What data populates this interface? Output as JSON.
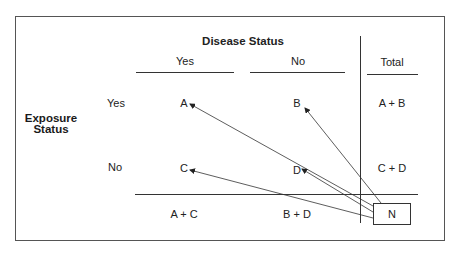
{
  "diagram": {
    "column_header": "Disease Status",
    "row_header": [
      "Exposure",
      "Status"
    ],
    "columns": [
      "Yes",
      "No"
    ],
    "total_label": "Total",
    "rows": [
      {
        "label": "Yes",
        "cells": [
          "A",
          "B"
        ],
        "total": "A + B"
      },
      {
        "label": "No",
        "cells": [
          "C",
          "D"
        ],
        "total": "C + D"
      }
    ],
    "column_totals": [
      "A + C",
      "B + D"
    ],
    "grand_total": "N",
    "arrows": [
      {
        "from": "N",
        "to": "A"
      },
      {
        "from": "N",
        "to": "B"
      },
      {
        "from": "N",
        "to": "C"
      },
      {
        "from": "N",
        "to": "D"
      }
    ],
    "colors": {
      "line": "#333333",
      "border": "#555555",
      "background": "#ffffff"
    }
  }
}
